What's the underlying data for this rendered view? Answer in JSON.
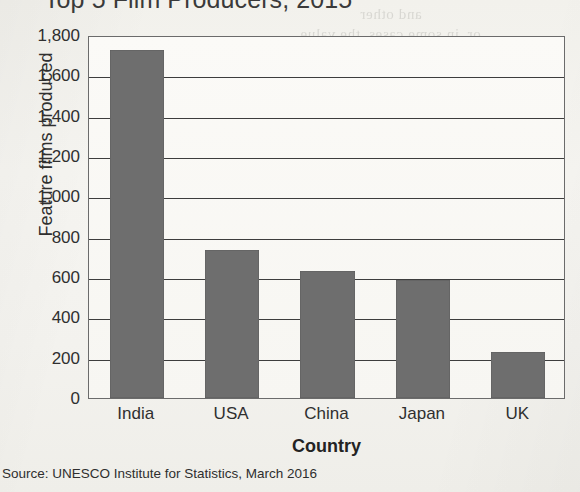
{
  "chart_data": {
    "type": "bar",
    "title": "Top 5 Film Producers, 2015",
    "xlabel": "Country",
    "ylabel": "Feature films produced",
    "categories": [
      "India",
      "USA",
      "China",
      "Japan",
      "UK"
    ],
    "values": [
      1725,
      735,
      630,
      585,
      230
    ],
    "ylim": [
      0,
      1800
    ],
    "ytick_step": 200,
    "ytick_labels": [
      "1,800",
      "1,600",
      "1,400",
      "1,200",
      "1,000",
      "800",
      "600",
      "400",
      "200",
      "0"
    ],
    "ytick_values": [
      1800,
      1600,
      1400,
      1200,
      1000,
      800,
      600,
      400,
      200,
      0
    ],
    "grid": "horizontal",
    "legend": "none",
    "bar_color": "#6e6e6e",
    "frame_color": "#6b6b6b",
    "plot_background": "#faf9f6"
  },
  "source_note": "Source: UNESCO Institute for Statistics, March 2016",
  "page": {
    "background": "#f4f3ef",
    "bleed_through": [
      "and other",
      "or, in some cases, the value",
      "and quality.",
      "The film industry illustrates this",
      "Literature. Unlike the film industry,",
      "little bearing on the escape",
      "cted and",
      "it is English, and",
      "no similar",
      "e cultural"
    ]
  }
}
